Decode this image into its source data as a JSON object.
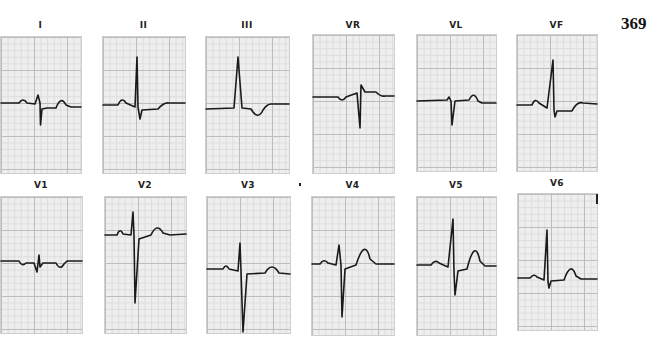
{
  "page_number": "369",
  "colors": {
    "trace": "#1a1a1a",
    "grid_major": "#bdbdbd",
    "grid_minor": "#dcdcdc",
    "paper": "#eeeeee"
  },
  "leads": [
    {
      "label": "I"
    },
    {
      "label": "II"
    },
    {
      "label": "III"
    },
    {
      "label": "VR"
    },
    {
      "label": "VL"
    },
    {
      "label": "VF"
    },
    {
      "label": "V1"
    },
    {
      "label": "V2"
    },
    {
      "label": "V3"
    },
    {
      "label": "V4"
    },
    {
      "label": "V5"
    },
    {
      "label": "V6"
    }
  ]
}
